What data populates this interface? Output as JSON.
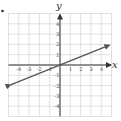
{
  "chart_data": {
    "type": "line",
    "title": "",
    "xlabel": "x",
    "ylabel": "y",
    "xlim": [
      -4.8,
      4.8
    ],
    "ylim": [
      -4.8,
      4.8
    ],
    "grid": true,
    "x_ticks": [
      "-4",
      "-3",
      "-2",
      "-1",
      "1",
      "2",
      "3",
      "4"
    ],
    "y_ticks": [
      "4",
      "3",
      "2",
      "1",
      "-1",
      "-2",
      "-3",
      "-4"
    ],
    "series": [
      {
        "name": "line",
        "equation": "y = (2/5)x",
        "slope": 0.4,
        "intercept": 0,
        "x": [
          -4.8,
          0,
          4.8
        ],
        "y": [
          -1.92,
          0,
          1.92
        ],
        "arrows": "both ends"
      }
    ],
    "colors": {
      "line": "#555555",
      "grid": "#cccccc",
      "axis": "#333333"
    }
  },
  "labels": {
    "x_axis": "x",
    "y_axis": "y",
    "bullet": "•"
  }
}
